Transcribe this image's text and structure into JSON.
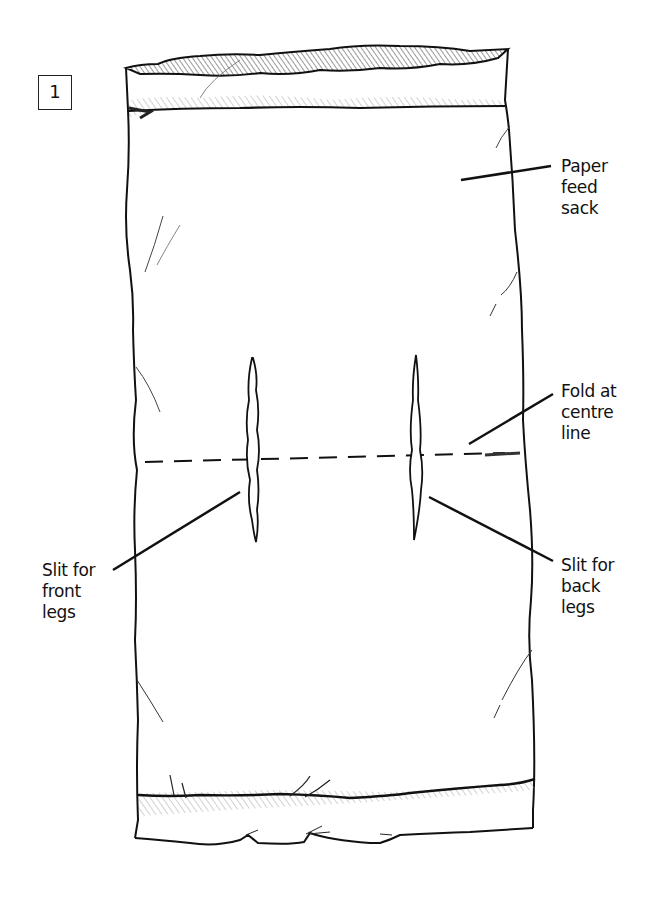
{
  "figure": {
    "step_number": "1",
    "colors": {
      "ink": "#111111",
      "background": "#ffffff",
      "hatch": "#555555"
    }
  },
  "labels": {
    "sack": {
      "lines": [
        "Paper",
        "feed",
        "sack"
      ]
    },
    "fold": {
      "lines": [
        "Fold at",
        "centre",
        "line"
      ]
    },
    "front_slit": {
      "lines": [
        "Slit for",
        "front",
        "legs"
      ]
    },
    "back_slit": {
      "lines": [
        "Slit for",
        "back",
        "legs"
      ]
    }
  }
}
